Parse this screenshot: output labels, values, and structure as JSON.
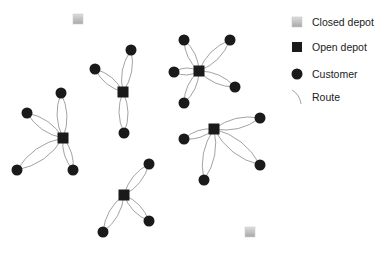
{
  "legend": {
    "items": [
      {
        "label": "Closed depot",
        "symbol": "closed-depot"
      },
      {
        "label": "Open depot",
        "symbol": "open-depot"
      },
      {
        "label": "Customer",
        "symbol": "customer"
      },
      {
        "label": "Route",
        "symbol": "route"
      }
    ]
  },
  "colors": {
    "open_depot": "#1a1a1a",
    "customer": "#1a1a1a",
    "closed_depot": "#b8b8b8",
    "route": "#8a8a8a"
  },
  "closed_depots": [
    {
      "x": 78,
      "y": 19
    },
    {
      "x": 250,
      "y": 232
    }
  ],
  "clusters": [
    {
      "depot": {
        "x": 63,
        "y": 138
      },
      "customers": [
        {
          "x": 61,
          "y": 93
        },
        {
          "x": 27,
          "y": 113
        },
        {
          "x": 17,
          "y": 170
        },
        {
          "x": 73,
          "y": 170
        }
      ]
    },
    {
      "depot": {
        "x": 123,
        "y": 92
      },
      "customers": [
        {
          "x": 131,
          "y": 50
        },
        {
          "x": 95,
          "y": 69
        },
        {
          "x": 124,
          "y": 133
        }
      ]
    },
    {
      "depot": {
        "x": 199,
        "y": 71
      },
      "customers": [
        {
          "x": 184,
          "y": 40
        },
        {
          "x": 230,
          "y": 40
        },
        {
          "x": 174,
          "y": 72
        },
        {
          "x": 235,
          "y": 87
        },
        {
          "x": 184,
          "y": 103
        }
      ]
    },
    {
      "depot": {
        "x": 214,
        "y": 129
      },
      "customers": [
        {
          "x": 260,
          "y": 118
        },
        {
          "x": 184,
          "y": 139
        },
        {
          "x": 260,
          "y": 165
        },
        {
          "x": 204,
          "y": 180
        }
      ]
    },
    {
      "depot": {
        "x": 124,
        "y": 195
      },
      "customers": [
        {
          "x": 149,
          "y": 164
        },
        {
          "x": 149,
          "y": 221
        },
        {
          "x": 103,
          "y": 232
        }
      ]
    }
  ]
}
